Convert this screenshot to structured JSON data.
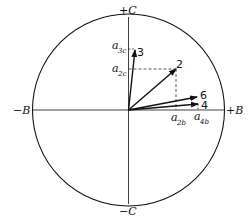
{
  "diagram": {
    "axes": {
      "top": "+C",
      "bottom": "−C",
      "left": "−B",
      "right": "+B"
    },
    "vectors": [
      {
        "label": "3",
        "x": 4,
        "y": 58
      },
      {
        "label": "2",
        "x": 48,
        "y": 40
      },
      {
        "label": "6",
        "x": 66,
        "y": 12
      },
      {
        "label": "4",
        "x": 67,
        "y": 5
      }
    ],
    "projections": {
      "a2c": {
        "base": "a",
        "sub": "2c"
      },
      "a3c": {
        "base": "a",
        "sub": "3c"
      },
      "a2b": {
        "base": "a",
        "sub": "2b"
      },
      "a4b": {
        "base": "a",
        "sub": "4b"
      }
    }
  }
}
